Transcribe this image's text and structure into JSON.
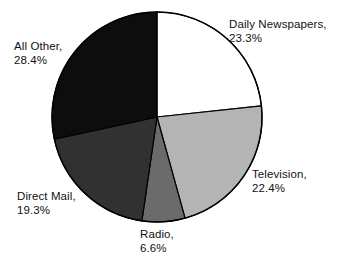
{
  "chart_data": {
    "type": "pie",
    "title": "",
    "subtitle": "",
    "xlabel": "",
    "ylabel": "",
    "legend_position": "none",
    "grid": false,
    "start_angle_deg": 0,
    "direction": "clockwise",
    "units": "percent",
    "categories": [
      "Daily Newspapers",
      "Television",
      "Radio",
      "Direct Mail",
      "All Other"
    ],
    "values": [
      23.3,
      22.4,
      6.6,
      19.3,
      28.4
    ],
    "slices": [
      {
        "name": "Daily Newspapers",
        "value": 23.3,
        "label_name": "Daily Newspapers,",
        "label_value": "23.3%",
        "color": "#ffffff",
        "stroke": "#000000",
        "start_deg": 0,
        "end_deg": 83.88
      },
      {
        "name": "Television",
        "value": 22.4,
        "label_name": "Television,",
        "label_value": "22.4%",
        "color": "#b4b4b4",
        "stroke": "#000000",
        "start_deg": 83.88,
        "end_deg": 164.52
      },
      {
        "name": "Radio",
        "value": 6.6,
        "label_name": "Radio,",
        "label_value": "6.6%",
        "color": "#6b6b6b",
        "stroke": "#000000",
        "start_deg": 164.52,
        "end_deg": 188.28
      },
      {
        "name": "Direct Mail",
        "value": 19.3,
        "label_name": "Direct Mail,",
        "label_value": "19.3%",
        "color": "#313131",
        "stroke": "#000000",
        "start_deg": 188.28,
        "end_deg": 257.76
      },
      {
        "name": "All Other",
        "value": 28.4,
        "label_name": "All Other,",
        "label_value": "28.4%",
        "color": "#0d0d0d",
        "stroke": "#000000",
        "start_deg": 257.76,
        "end_deg": 360
      }
    ]
  },
  "geometry": {
    "center_x": 157,
    "center_y": 117,
    "radius": 105
  }
}
